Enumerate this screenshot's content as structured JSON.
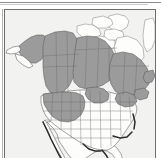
{
  "figure": {
    "kind": "species-range-map",
    "region": "North America",
    "width_px": 161,
    "height_px": 158
  },
  "panel": {
    "border_color": "#6e6e6e",
    "ocean_color": "#f2f2f0"
  },
  "legend": {
    "range_shade_color": "#9b9b9b",
    "non_range_color": "#fdfdfb",
    "outline_color": "#5a5a5a",
    "emphasis_coast_color": "#2b2b2b"
  },
  "map": {
    "title": "",
    "caption": "",
    "shaded_range_areas": [
      "Alaska (interior and south-central)",
      "Yukon",
      "British Columbia",
      "Alberta",
      "Saskatchewan",
      "Manitoba",
      "Ontario (northern and central)",
      "Quebec (central and southern)",
      "Labrador",
      "Newfoundland",
      "Maritime provinces",
      "Washington",
      "Oregon",
      "Idaho",
      "Montana",
      "Wyoming",
      "Utah",
      "Colorado",
      "Nevada (north)",
      "California (northeast)",
      "Minnesota (north)",
      "Wisconsin (north)",
      "Michigan (upper)",
      "Maine"
    ],
    "unshaded_areas": [
      "Arctic Archipelago",
      "Greenland (west margin)",
      "Great Plains (central and southern)",
      "Texas",
      "Southeastern United States",
      "Florida",
      "Mexico",
      "Baja California"
    ],
    "emphasized_coastlines": [
      "Pacific coast of Baja California",
      "Gulf Coast",
      "Florida peninsula",
      "Atlantic coast (Carolinas)"
    ]
  }
}
